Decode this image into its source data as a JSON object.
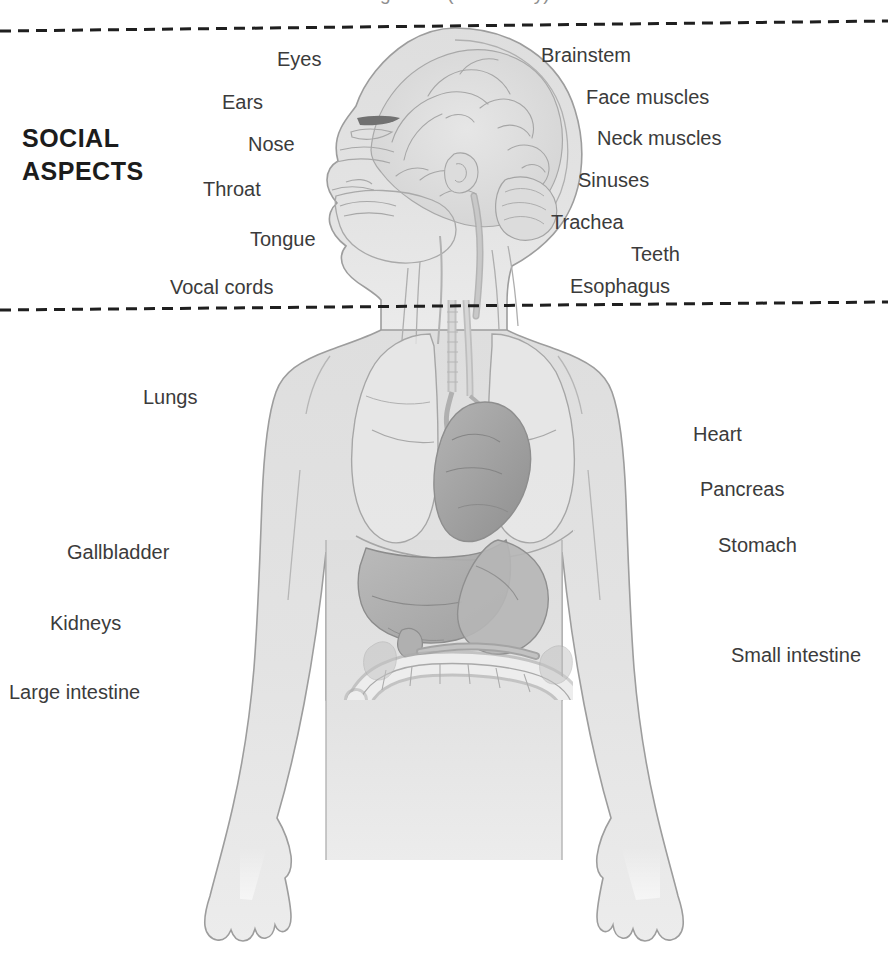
{
  "page": {
    "width": 888,
    "height": 967,
    "background_color": "#ffffff",
    "cropped_title": "and the digestive (alimentary) tract",
    "label_color": "#3b3b3b",
    "heading_color": "#1c1c1c",
    "body_fill_color": "#e2e2e2",
    "organ_shade_color": "#a8a8a8",
    "outline_color": "#9a9a9a"
  },
  "section_heading": {
    "line1": "SOCIAL",
    "line2": "ASPECTS"
  },
  "dividers": [
    {
      "name": "upper-dashed-divider",
      "y_left": 31,
      "y_right": 21
    },
    {
      "name": "lower-dashed-divider",
      "y_left": 310,
      "y_right": 302
    }
  ],
  "labels": {
    "upper_left": [
      {
        "text": "Eyes",
        "x": 277,
        "y": 48
      },
      {
        "text": "Ears",
        "x": 222,
        "y": 91
      },
      {
        "text": "Nose",
        "x": 248,
        "y": 133
      },
      {
        "text": "Throat",
        "x": 203,
        "y": 178
      },
      {
        "text": "Tongue",
        "x": 250,
        "y": 228
      },
      {
        "text": "Vocal cords",
        "x": 170,
        "y": 276
      }
    ],
    "upper_right": [
      {
        "text": "Brainstem",
        "x": 541,
        "y": 44
      },
      {
        "text": "Face muscles",
        "x": 586,
        "y": 86
      },
      {
        "text": "Neck muscles",
        "x": 597,
        "y": 127
      },
      {
        "text": "Sinuses",
        "x": 578,
        "y": 169
      },
      {
        "text": "Trachea",
        "x": 551,
        "y": 211
      },
      {
        "text": "Teeth",
        "x": 631,
        "y": 243
      },
      {
        "text": "Esophagus",
        "x": 570,
        "y": 275
      }
    ],
    "lower_left": [
      {
        "text": "Lungs",
        "x": 143,
        "y": 386
      },
      {
        "text": "Gallbladder",
        "x": 67,
        "y": 541
      },
      {
        "text": "Kidneys",
        "x": 50,
        "y": 612
      },
      {
        "text": "Large intestine",
        "x": 9,
        "y": 681
      }
    ],
    "lower_right": [
      {
        "text": "Heart",
        "x": 693,
        "y": 423
      },
      {
        "text": "Pancreas",
        "x": 700,
        "y": 478
      },
      {
        "text": "Stomach",
        "x": 718,
        "y": 534
      },
      {
        "text": "Small intestine",
        "x": 731,
        "y": 644
      }
    ]
  },
  "figure": {
    "name": "human-body-anatomy-illustration",
    "organs": [
      "brain",
      "brainstem",
      "trachea",
      "esophagus",
      "lungs",
      "heart",
      "liver",
      "stomach",
      "pancreas",
      "gallbladder",
      "large intestine",
      "small intestine",
      "kidneys"
    ]
  }
}
